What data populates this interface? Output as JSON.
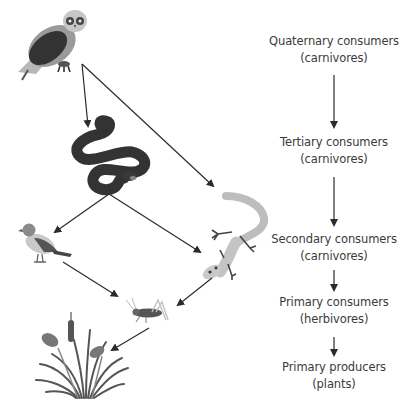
{
  "diagram": {
    "type": "food-web",
    "organisms": [
      {
        "id": "owl",
        "name": "Owl",
        "icon": "owl-icon"
      },
      {
        "id": "snake",
        "name": "Snake",
        "icon": "snake-icon"
      },
      {
        "id": "bird",
        "name": "Bird",
        "icon": "bird-icon"
      },
      {
        "id": "lizard",
        "name": "Lizard",
        "icon": "lizard-icon"
      },
      {
        "id": "grasshopper",
        "name": "Grasshopper",
        "icon": "grasshopper-icon"
      },
      {
        "id": "plants",
        "name": "Plants (reeds/grass)",
        "icon": "plants-icon"
      }
    ],
    "edges": [
      {
        "from": "owl",
        "to": "snake"
      },
      {
        "from": "owl",
        "to": "lizard"
      },
      {
        "from": "snake",
        "to": "bird"
      },
      {
        "from": "snake",
        "to": "lizard"
      },
      {
        "from": "bird",
        "to": "grasshopper"
      },
      {
        "from": "lizard",
        "to": "grasshopper"
      },
      {
        "from": "grasshopper",
        "to": "plants"
      }
    ],
    "levels": [
      {
        "title": "Quaternary consumers",
        "subtitle": "(carnivores)"
      },
      {
        "title": "Tertiary consumers",
        "subtitle": "(carnivores)"
      },
      {
        "title": "Secondary consumers",
        "subtitle": "(carnivores)"
      },
      {
        "title": "Primary consumers",
        "subtitle": "(herbivores)"
      },
      {
        "title": "Primary producers",
        "subtitle": "(plants)"
      }
    ],
    "colors": {
      "arrow": "#2b2b2b",
      "text": "#3a3a3a",
      "dark": "#333333",
      "mid": "#777777",
      "light": "#b5b5b5"
    }
  }
}
